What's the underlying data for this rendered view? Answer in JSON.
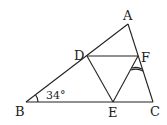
{
  "diagram": {
    "type": "triangle-geometry",
    "points": {
      "A": {
        "label": "A",
        "x": 128,
        "y": 24
      },
      "B": {
        "label": "B",
        "x": 26,
        "y": 102
      },
      "C": {
        "label": "C",
        "x": 153,
        "y": 102
      },
      "D": {
        "label": "D",
        "x": 87,
        "y": 56
      },
      "E": {
        "label": "E",
        "x": 113,
        "y": 102
      },
      "F": {
        "label": "F",
        "x": 138,
        "y": 56
      }
    },
    "segments": [
      "AB",
      "BC",
      "CA",
      "DF",
      "DE",
      "EF"
    ],
    "angle_B_label": "34°",
    "marked_angle": "EFC (double arc)",
    "line_color": "#222222"
  }
}
